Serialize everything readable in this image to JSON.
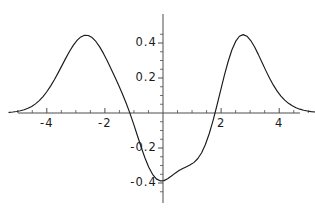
{
  "chart_data": {
    "type": "line",
    "title": "",
    "xlabel": "",
    "ylabel": "",
    "xlim": [
      -5.3,
      5.3
    ],
    "ylim": [
      -0.52,
      0.6
    ],
    "grid": false,
    "legend": null,
    "axes": {
      "x_axis_at_y": 0,
      "y_axis_at_x": 0,
      "x_tick_labels": [
        "-4",
        "-2",
        "2",
        "4"
      ],
      "x_tick_values": [
        -4,
        -2,
        2,
        4
      ],
      "y_tick_labels": [
        "0.4",
        "0.2",
        "-0.2",
        "-0.4"
      ],
      "y_tick_values": [
        0.4,
        0.2,
        -0.2,
        -0.4
      ],
      "minor_x_ticks": [
        -5,
        -4.5,
        -3.5,
        -3,
        -2.5,
        -1.5,
        -1,
        -0.5,
        0.5,
        1,
        1.5,
        2.5,
        3,
        3.5,
        4.5,
        5
      ],
      "minor_y_ticks": [
        0.45,
        0.35,
        0.3,
        0.25,
        0.15,
        0.1,
        0.05,
        -0.05,
        -0.1,
        -0.15,
        -0.25,
        -0.3,
        -0.35,
        -0.45
      ]
    },
    "curve_color": "#1a1a1a",
    "axis_color": "#4d4d4d",
    "features": {
      "center_peak": {
        "x": 0.0,
        "y": 0.45
      },
      "minima": [
        {
          "x": -1.15,
          "y": -0.47
        },
        {
          "x": 1.15,
          "y": -0.47
        }
      ],
      "side_peaks": [
        {
          "x": -2.5,
          "y": 0.56
        },
        {
          "x": 2.5,
          "y": 0.56
        }
      ],
      "zero_crossings": [
        -1.75,
        -0.6,
        0.6,
        1.75
      ]
    },
    "x": [
      -5.3,
      -5.17,
      -5.04,
      -4.91,
      -4.78,
      -4.65,
      -4.52,
      -4.39,
      -4.26,
      -4.13,
      -4.0,
      -3.87,
      -3.74,
      -3.61,
      -3.48,
      -3.35,
      -3.22,
      -3.09,
      -2.96,
      -2.83,
      -2.7,
      -2.57,
      -2.44,
      -2.31,
      -2.18,
      -2.05,
      -1.92,
      -1.79,
      -1.66,
      -1.53,
      -1.4,
      -1.27,
      -1.14,
      -1.01,
      -0.88,
      -0.75,
      -0.62,
      -0.49,
      -0.36,
      -0.23,
      -0.1,
      0.03,
      0.16,
      0.29,
      0.42,
      0.55,
      0.68,
      0.81,
      0.94,
      1.07,
      1.2,
      1.33,
      1.46,
      1.59,
      1.72,
      1.85,
      1.98,
      2.11,
      2.24,
      2.37,
      2.5,
      2.63,
      2.76,
      2.89,
      3.02,
      3.15,
      3.28,
      3.41,
      3.54,
      3.67,
      3.8,
      3.93,
      4.06,
      4.19,
      4.32,
      4.45,
      4.58,
      4.71,
      4.84,
      4.97,
      5.1,
      5.23,
      5.3
    ],
    "y": [
      0.0035,
      0.0055,
      0.0084,
      0.0126,
      0.0185,
      0.0267,
      0.0377,
      0.0522,
      0.0707,
      0.0937,
      0.1213,
      0.1535,
      0.1898,
      0.2293,
      0.2707,
      0.3122,
      0.3516,
      0.3867,
      0.4151,
      0.4348,
      0.4444,
      0.4431,
      0.431,
      0.4088,
      0.378,
      0.3405,
      0.2984,
      0.2535,
      0.2071,
      0.1595,
      0.11,
      0.057,
      -0.0009,
      -0.0637,
      -0.1297,
      -0.1957,
      -0.2573,
      -0.3101,
      -0.3505,
      -0.3764,
      -0.3877,
      -0.3864,
      -0.3759,
      -0.3604,
      -0.3438,
      -0.3289,
      -0.3168,
      -0.3067,
      -0.2963,
      -0.2821,
      -0.2601,
      -0.2268,
      -0.1798,
      -0.1186,
      -0.0447,
      0.0386,
      0.1266,
      0.2134,
      0.293,
      0.3597,
      0.4091,
      0.4386,
      0.448,
      0.4388,
      0.4142,
      0.3782,
      0.335,
      0.2885,
      0.2421,
      0.1983,
      0.159,
      0.125,
      0.0966,
      0.0735,
      0.0552,
      0.0409,
      0.0301,
      0.0219,
      0.0158,
      0.0113,
      0.0081,
      0.0057,
      0.0048
    ]
  }
}
